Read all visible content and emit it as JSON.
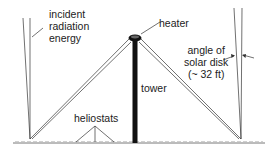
{
  "diagram": {
    "labels": {
      "incident": [
        "incident",
        "radiation",
        "energy"
      ],
      "heater": "heater",
      "angle": [
        "angle of",
        "solar disk",
        "(~ 32 ft)"
      ],
      "tower": "tower",
      "heliostats": "heliostats"
    },
    "colors": {
      "line": "#333333",
      "tower": "#111111",
      "ground_hatch": "#aaaaaa"
    }
  }
}
